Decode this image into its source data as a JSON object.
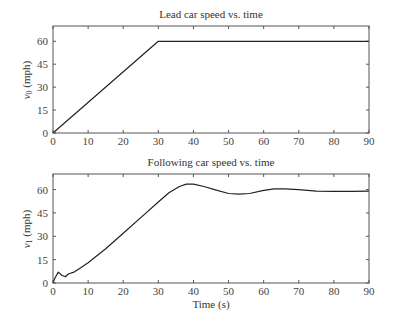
{
  "chart_data": [
    {
      "type": "line",
      "title": "Lead car speed vs. time",
      "xlabel": "",
      "ylabel": "v0 (mph)",
      "ylabel_symbol": "v",
      "ylabel_subscript": "0",
      "ylabel_unit": "(mph)",
      "xlim": [
        0,
        90
      ],
      "ylim": [
        0,
        70
      ],
      "xticks": [
        0,
        10,
        20,
        30,
        40,
        50,
        60,
        70,
        80,
        90
      ],
      "yticks": [
        0,
        15,
        30,
        45,
        60
      ],
      "grid": false,
      "series": [
        {
          "name": "v0",
          "x": [
            0,
            30,
            90
          ],
          "y": [
            0,
            60,
            60
          ]
        }
      ]
    },
    {
      "type": "line",
      "title": "Following car speed vs. time",
      "xlabel": "Time (s)",
      "ylabel": "v1 (mph)",
      "ylabel_symbol": "v",
      "ylabel_subscript": "1",
      "ylabel_unit": "(mph)",
      "xlim": [
        0,
        90
      ],
      "ylim": [
        0,
        70
      ],
      "xticks": [
        0,
        10,
        20,
        30,
        40,
        50,
        60,
        70,
        80,
        90
      ],
      "yticks": [
        0,
        15,
        30,
        45,
        60
      ],
      "grid": false,
      "series": [
        {
          "name": "v1",
          "x": [
            0,
            0.5,
            1.5,
            2.5,
            3.5,
            4.5,
            6,
            8,
            10,
            15,
            20,
            25,
            30,
            33,
            36,
            38,
            40,
            43,
            46,
            50,
            53,
            56,
            60,
            63,
            66,
            70,
            75,
            80,
            85,
            90
          ],
          "y": [
            0,
            3,
            7,
            5,
            4,
            6,
            7,
            10,
            13,
            22,
            32,
            42,
            52,
            58,
            62,
            63.5,
            63.5,
            62,
            60,
            57.5,
            57,
            57.5,
            59.5,
            60.5,
            60.5,
            60,
            59,
            58.8,
            58.8,
            59
          ]
        }
      ]
    }
  ]
}
